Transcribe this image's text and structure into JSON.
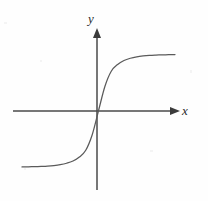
{
  "figure": {
    "background_color": "#fefefe",
    "axis_color": "#4a4a4a",
    "curve_color": "#5a5a5a",
    "label_color": "#2b2b2b"
  },
  "axes": {
    "x_label": "x",
    "y_label": "y",
    "origin": {
      "x": 97,
      "y": 111
    },
    "x_axis": {
      "start_x": 13,
      "end_x": 180,
      "y": 111,
      "arrow": "right"
    },
    "y_axis": {
      "x": 97,
      "start_y": 190,
      "end_y": 28,
      "arrow": "up"
    }
  },
  "chart_data": {
    "type": "line",
    "title": "",
    "subtitle": "",
    "xlabel": "x",
    "ylabel": "y",
    "grid": false,
    "legend": null,
    "xlim": [
      -6,
      6
    ],
    "ylim": [
      -1.2,
      1.2
    ],
    "axis_style": "arrowed-cartesian",
    "tick_labels": {
      "x": [],
      "y": []
    },
    "annotations": [],
    "series": [
      {
        "name": "sigmoid",
        "description": "Monotonic increasing S-shaped curve through the origin with horizontal asymptotes above and below the x-axis",
        "x": [
          -6.0,
          -5.5,
          -5.0,
          -4.5,
          -4.0,
          -3.5,
          -3.0,
          -2.5,
          -2.0,
          -1.5,
          -1.0,
          -0.5,
          0.0,
          0.5,
          1.0,
          1.5,
          2.0,
          2.5,
          3.0,
          3.5,
          4.0,
          4.5,
          5.0,
          5.5,
          6.0
        ],
        "y": [
          -0.995,
          -0.993,
          -0.99,
          -0.986,
          -0.98,
          -0.97,
          -0.955,
          -0.93,
          -0.89,
          -0.82,
          -0.7,
          -0.43,
          0.0,
          0.43,
          0.7,
          0.82,
          0.89,
          0.93,
          0.955,
          0.97,
          0.98,
          0.986,
          0.99,
          0.993,
          0.995
        ]
      }
    ]
  }
}
